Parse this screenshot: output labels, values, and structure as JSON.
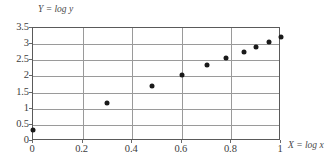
{
  "chart_data": {
    "type": "scatter",
    "title": "",
    "xlabel": "X = log x",
    "ylabel": "Y = log y",
    "xlim": [
      0,
      1
    ],
    "ylim": [
      0,
      3.5
    ],
    "grid": true,
    "legend": "none",
    "xticks": [
      "0",
      "0.2",
      "0.4",
      "0.6",
      "0.8",
      "1"
    ],
    "xtick_values": [
      0,
      0.2,
      0.4,
      0.6,
      0.8,
      1
    ],
    "yticks": [
      "0",
      "0.5",
      "1",
      "1.5",
      "2",
      "2.5",
      "3",
      "3.5"
    ],
    "ytick_values": [
      0,
      0.5,
      1,
      1.5,
      2,
      2.5,
      3,
      3.5
    ],
    "series": [
      {
        "name": "data",
        "marker": "filled-circle",
        "color": "#1a1a1a",
        "points": [
          {
            "x": 0.0,
            "y": 0.35
          },
          {
            "x": 0.3,
            "y": 1.18
          },
          {
            "x": 0.48,
            "y": 1.7
          },
          {
            "x": 0.6,
            "y": 2.05
          },
          {
            "x": 0.7,
            "y": 2.35
          },
          {
            "x": 0.78,
            "y": 2.56
          },
          {
            "x": 0.85,
            "y": 2.75
          },
          {
            "x": 0.9,
            "y": 2.92
          },
          {
            "x": 0.95,
            "y": 3.07
          },
          {
            "x": 1.0,
            "y": 3.21
          }
        ]
      }
    ]
  }
}
